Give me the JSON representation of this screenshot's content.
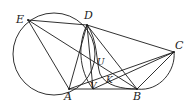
{
  "diagram": {
    "type": "geometry",
    "points": {
      "E": {
        "label": "E",
        "x": 28,
        "y": 20
      },
      "D": {
        "label": "D",
        "x": 87,
        "y": 25
      },
      "C": {
        "label": "C",
        "x": 174,
        "y": 52
      },
      "A": {
        "label": "A",
        "x": 69,
        "y": 89
      },
      "B": {
        "label": "B",
        "x": 137,
        "y": 89
      },
      "U": {
        "label": "U",
        "x": 95,
        "y": 63
      },
      "V": {
        "label": "V",
        "x": 93,
        "y": 89
      },
      "K": {
        "label": "K",
        "x": 108,
        "y": 77
      }
    },
    "segments": [
      "ED",
      "EA",
      "EB",
      "DA",
      "DB",
      "DC",
      "DV",
      "AB",
      "AC",
      "BC",
      "CV"
    ],
    "circles": [
      "circle through E, D, A",
      "arc D–B",
      "arc D–V",
      "arc B–C"
    ]
  }
}
